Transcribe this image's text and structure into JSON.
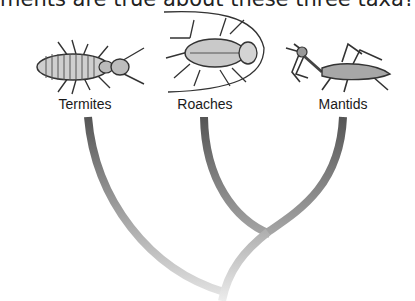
{
  "question": {
    "text": "ments are true about these three taxa?"
  },
  "taxa": [
    {
      "name": "Termites",
      "label_x": 85,
      "label_y": 96,
      "branch_top_x": 88
    },
    {
      "name": "Roaches",
      "label_x": 205,
      "label_y": 96,
      "branch_top_x": 204
    },
    {
      "name": "Mantids",
      "label_x": 343,
      "label_y": 96,
      "branch_top_x": 343
    }
  ],
  "tree": {
    "branch_top_y": 117,
    "inner_node": {
      "x": 268,
      "y": 232
    },
    "root_node": {
      "x": 224,
      "y": 292
    },
    "colors": {
      "top": "#555555",
      "bottom": "#e2e2e2"
    }
  }
}
